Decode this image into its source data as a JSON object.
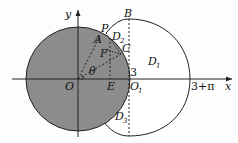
{
  "diagram": {
    "type": "geometry-figure",
    "axes": {
      "x_label": "x",
      "y_label": "y",
      "origin_label": "O"
    },
    "points": [
      {
        "label": "O",
        "role": "origin / center of shaded circle"
      },
      {
        "label": "O",
        "subscript": "1",
        "role": "point on x-axis where dashed vertical line meets axis"
      },
      {
        "label": "B",
        "role": "top of dashed vertical line on outer arc"
      },
      {
        "label": "P",
        "role": "point on shaded circle boundary, start of outer curve"
      },
      {
        "label": "A",
        "role": "point on shaded circle"
      },
      {
        "label": "C",
        "role": "point on shaded circle boundary at dashed line"
      },
      {
        "label": "F",
        "role": "interior point"
      },
      {
        "label": "E",
        "role": "foot on x-axis"
      }
    ],
    "regions": [
      {
        "label": "D",
        "subscript": "1",
        "role": "large white region right of dashed line"
      },
      {
        "label": "D",
        "subscript": "2",
        "role": "small region between P and C"
      },
      {
        "label": "D",
        "subscript": "3",
        "role": "region below, between shaded circle and outer curve"
      }
    ],
    "angle_label": "θ",
    "tick_labels": {
      "three": "3",
      "three_plus_pi": "3+π"
    },
    "colors": {
      "shaded_circle": "#8c8c8c",
      "stroke": "#222222",
      "background": "#fdfdfd"
    }
  }
}
